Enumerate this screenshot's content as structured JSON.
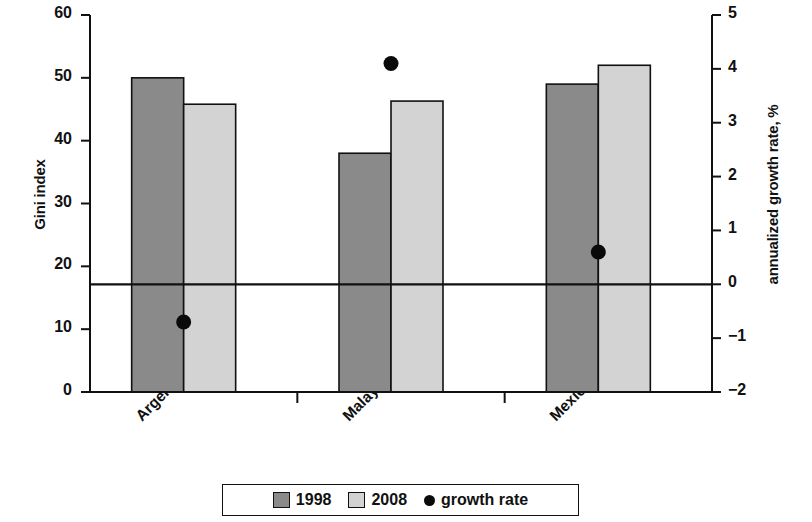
{
  "chart_data": {
    "type": "bar",
    "title": "",
    "subtitle": "",
    "categories": [
      "Argentina",
      "Malaysia",
      "Mexico"
    ],
    "series": [
      {
        "name": "1998",
        "type": "bar",
        "axis": "left",
        "color": "#8a8a8a",
        "values": [
          50.0,
          38.0,
          49.0
        ]
      },
      {
        "name": "2008",
        "type": "bar",
        "axis": "left",
        "color": "#d3d3d3",
        "values": [
          45.8,
          46.3,
          52.0
        ]
      },
      {
        "name": "growth rate",
        "type": "scatter",
        "axis": "right",
        "color": "#0a0a0a",
        "values": [
          -0.7,
          4.1,
          0.6
        ]
      }
    ],
    "xlabel": "",
    "ylabel": "Gini index",
    "ylabel_right": "annualized growth rate, %",
    "ylim": [
      0,
      60
    ],
    "ylim_right": [
      -2,
      5
    ],
    "yticks": [
      0,
      10,
      20,
      30,
      40,
      50,
      60
    ],
    "yticks_right": [
      -2,
      -1,
      0,
      1,
      2,
      3,
      4,
      5
    ],
    "ytick_labels": [
      "0",
      "10",
      "20",
      "30",
      "40",
      "50",
      "60"
    ],
    "ytick_labels_right": [
      "−2",
      "−1",
      "0",
      "1",
      "2",
      "3",
      "4",
      "5"
    ],
    "grid": false,
    "zero_line_right": 0,
    "legend_position": "bottom"
  },
  "axes": {
    "left_title": "Gini index",
    "right_title": "annualized growth rate, %"
  },
  "legend": {
    "items": [
      {
        "label": "1998",
        "marker": "square-dark-swatch"
      },
      {
        "label": "2008",
        "marker": "square-light-swatch"
      },
      {
        "label": "growth rate",
        "marker": "dot-marker"
      }
    ]
  },
  "colors": {
    "bar_1998": "#8a8a8a",
    "bar_2008": "#d3d3d3",
    "dot": "#0a0a0a",
    "axis": "#111111"
  }
}
